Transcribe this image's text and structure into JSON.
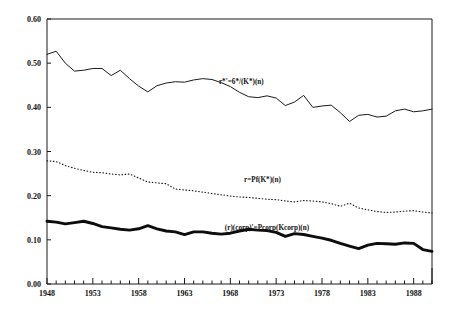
{
  "chart_data": {
    "type": "line",
    "title": "",
    "subtitle": "",
    "xlabel": "",
    "ylabel": "",
    "xlim": [
      1948,
      1990
    ],
    "ylim": [
      0.0,
      0.6
    ],
    "grid": false,
    "legend_position": "inline-annotations",
    "y_ticks": [
      "0.00",
      "0.10",
      "0.20",
      "0.30",
      "0.40",
      "0.50",
      "0.60"
    ],
    "y_tick_values": [
      0.0,
      0.1,
      0.2,
      0.3,
      0.4,
      0.5,
      0.6
    ],
    "x_ticks": [
      "1948",
      "1953",
      "1958",
      "1963",
      "1968",
      "1973",
      "1978",
      "1983",
      "1988"
    ],
    "x_tick_values": [
      1948,
      1953,
      1958,
      1963,
      1968,
      1973,
      1978,
      1983,
      1988
    ],
    "x_minor_interval": 1,
    "x": [
      1948,
      1949,
      1950,
      1951,
      1952,
      1953,
      1954,
      1955,
      1956,
      1957,
      1958,
      1959,
      1960,
      1961,
      1962,
      1963,
      1964,
      1965,
      1966,
      1967,
      1968,
      1969,
      1970,
      1971,
      1972,
      1973,
      1974,
      1975,
      1976,
      1977,
      1978,
      1979,
      1980,
      1981,
      1982,
      1983,
      1984,
      1985,
      1986,
      1987,
      1988,
      1989,
      1990
    ],
    "series": [
      {
        "name": "r*'=6*/(K*)(n)",
        "style": "solid-thin",
        "annotation": "r*'=6*/(K*)(n)",
        "annotation_x": 1969.2,
        "annotation_y": 0.452,
        "values": [
          0.52,
          0.527,
          0.5,
          0.482,
          0.484,
          0.488,
          0.488,
          0.472,
          0.484,
          0.465,
          0.448,
          0.435,
          0.449,
          0.455,
          0.458,
          0.457,
          0.462,
          0.465,
          0.463,
          0.456,
          0.447,
          0.434,
          0.424,
          0.422,
          0.426,
          0.421,
          0.404,
          0.412,
          0.427,
          0.4,
          0.403,
          0.405,
          0.388,
          0.368,
          0.382,
          0.384,
          0.378,
          0.38,
          0.392,
          0.396,
          0.39,
          0.392,
          0.396
        ]
      },
      {
        "name": "r=Pf(K*)(n)",
        "style": "dotted",
        "annotation": "r=Pf(K*)(n)",
        "annotation_x": 1971.5,
        "annotation_y": 0.232,
        "values": [
          0.279,
          0.277,
          0.268,
          0.262,
          0.257,
          0.253,
          0.252,
          0.249,
          0.247,
          0.249,
          0.24,
          0.231,
          0.229,
          0.227,
          0.215,
          0.213,
          0.211,
          0.208,
          0.205,
          0.202,
          0.199,
          0.197,
          0.196,
          0.194,
          0.192,
          0.191,
          0.188,
          0.186,
          0.189,
          0.188,
          0.186,
          0.182,
          0.176,
          0.183,
          0.172,
          0.168,
          0.164,
          0.162,
          0.163,
          0.165,
          0.166,
          0.163,
          0.161
        ]
      },
      {
        "name": "(r)(corp)'=Pcorp(Kcorp)(n)",
        "style": "solid-thick",
        "annotation": "(r)(corp)'=Pcorp(Kcorp)(n)",
        "annotation_x": 1972.0,
        "annotation_y": 0.123,
        "values": [
          0.142,
          0.14,
          0.136,
          0.139,
          0.142,
          0.137,
          0.13,
          0.127,
          0.124,
          0.122,
          0.125,
          0.132,
          0.125,
          0.12,
          0.118,
          0.112,
          0.118,
          0.118,
          0.115,
          0.113,
          0.115,
          0.12,
          0.124,
          0.122,
          0.121,
          0.117,
          0.108,
          0.114,
          0.112,
          0.108,
          0.104,
          0.099,
          0.092,
          0.086,
          0.08,
          0.088,
          0.092,
          0.091,
          0.09,
          0.093,
          0.092,
          0.078,
          0.074
        ]
      }
    ]
  }
}
